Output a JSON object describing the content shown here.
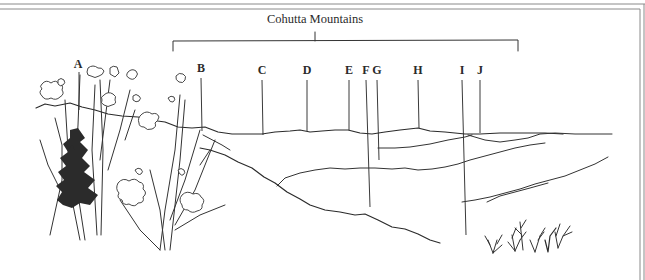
{
  "figure": {
    "title": "Cohutta Mountains",
    "bracket": {
      "x_start": 173,
      "x_end": 518,
      "y": 40,
      "tick_x": 315
    },
    "labels": [
      {
        "id": "A",
        "text": "A",
        "x": 78,
        "y": 66,
        "line_top": 71,
        "line_bottom": 100
      },
      {
        "id": "B",
        "text": "B",
        "x": 201,
        "y": 70,
        "line_top": 76,
        "line_bottom": 131
      },
      {
        "id": "C",
        "text": "C",
        "x": 262,
        "y": 72,
        "line_top": 78,
        "line_bottom": 134
      },
      {
        "id": "D",
        "text": "D",
        "x": 307,
        "y": 72,
        "line_top": 78,
        "line_bottom": 131
      },
      {
        "id": "E",
        "text": "E",
        "x": 349,
        "y": 72,
        "line_top": 78,
        "line_bottom": 130
      },
      {
        "id": "F",
        "text": "F",
        "x": 366,
        "y": 72,
        "line_top": 78,
        "line_bottom": 207
      },
      {
        "id": "G",
        "text": "G",
        "x": 377,
        "y": 72,
        "line_top": 78,
        "line_bottom": 160
      },
      {
        "id": "H",
        "text": "H",
        "x": 418,
        "y": 72,
        "line_top": 78,
        "line_bottom": 128
      },
      {
        "id": "I",
        "text": "I",
        "x": 462,
        "y": 72,
        "line_top": 78,
        "line_bottom": 235
      },
      {
        "id": "J",
        "text": "J",
        "x": 480,
        "y": 72,
        "line_top": 78,
        "line_bottom": 133
      }
    ],
    "elements": {
      "foreground": "wildflowers-and-shrubs",
      "background": "mountain-ridgelines",
      "lower_right": "grass-tufts"
    }
  }
}
